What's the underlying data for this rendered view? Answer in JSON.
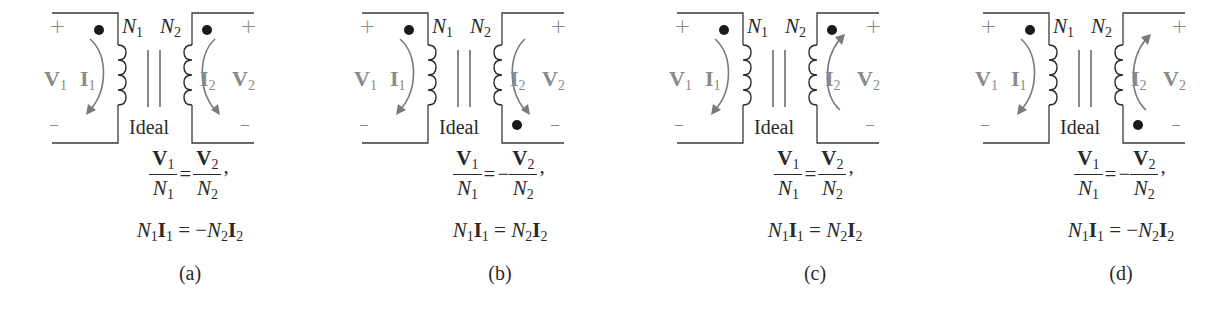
{
  "figure": {
    "labels": {
      "n1": "N",
      "n1_sub": "1",
      "n2": "N",
      "n2_sub": "2",
      "v1": "V",
      "v1_sub": "1",
      "v2": "V",
      "v2_sub": "2",
      "i1": "I",
      "i1_sub": "1",
      "i2": "I",
      "i2_sub": "2",
      "plus": "+",
      "minus": "–",
      "ideal": "Ideal"
    },
    "colors": {
      "wire": "#3a3a3a",
      "current_arrow": "#7a7a7a",
      "dot": "#1a1a1a",
      "text_gray": "#8a8a8a",
      "text": "#2a2a2a"
    },
    "panels": [
      {
        "caption": "(a)",
        "secondary_dot": "top",
        "i1_direction": "down",
        "i2_direction": "down",
        "voltage_eq": {
          "lhs_num": "V",
          "lhs_num_sub": "1",
          "lhs_den": "N",
          "lhs_den_sub": "1",
          "sign": "=",
          "neg": "",
          "rhs_num": "V",
          "rhs_num_sub": "2",
          "rhs_den": "N",
          "rhs_den_sub": "2",
          "trail": ","
        },
        "current_eq": {
          "n1": "N",
          "n1_sub": "1",
          "i1": "I",
          "i1_sub": "1",
          "eq": " = ",
          "neg": "−",
          "n2": "N",
          "n2_sub": "2",
          "i2": "I",
          "i2_sub": "2"
        }
      },
      {
        "caption": "(b)",
        "secondary_dot": "bottom",
        "i1_direction": "down",
        "i2_direction": "down",
        "voltage_eq": {
          "lhs_num": "V",
          "lhs_num_sub": "1",
          "lhs_den": "N",
          "lhs_den_sub": "1",
          "sign": "=",
          "neg": "−",
          "rhs_num": "V",
          "rhs_num_sub": "2",
          "rhs_den": "N",
          "rhs_den_sub": "2",
          "trail": ","
        },
        "current_eq": {
          "n1": "N",
          "n1_sub": "1",
          "i1": "I",
          "i1_sub": "1",
          "eq": " = ",
          "neg": "",
          "n2": "N",
          "n2_sub": "2",
          "i2": "I",
          "i2_sub": "2"
        }
      },
      {
        "caption": "(c)",
        "secondary_dot": "top",
        "i1_direction": "down",
        "i2_direction": "up",
        "voltage_eq": {
          "lhs_num": "V",
          "lhs_num_sub": "1",
          "lhs_den": "N",
          "lhs_den_sub": "1",
          "sign": "=",
          "neg": "",
          "rhs_num": "V",
          "rhs_num_sub": "2",
          "rhs_den": "N",
          "rhs_den_sub": "2",
          "trail": ","
        },
        "current_eq": {
          "n1": "N",
          "n1_sub": "1",
          "i1": "I",
          "i1_sub": "1",
          "eq": " = ",
          "neg": "",
          "n2": "N",
          "n2_sub": "2",
          "i2": "I",
          "i2_sub": "2"
        }
      },
      {
        "caption": "(d)",
        "secondary_dot": "bottom",
        "i1_direction": "down",
        "i2_direction": "up",
        "voltage_eq": {
          "lhs_num": "V",
          "lhs_num_sub": "1",
          "lhs_den": "N",
          "lhs_den_sub": "1",
          "sign": "=",
          "neg": "−",
          "rhs_num": "V",
          "rhs_num_sub": "2",
          "rhs_den": "N",
          "rhs_den_sub": "2",
          "trail": ","
        },
        "current_eq": {
          "n1": "N",
          "n1_sub": "1",
          "i1": "I",
          "i1_sub": "1",
          "eq": " = ",
          "neg": "−",
          "n2": "N",
          "n2_sub": "2",
          "i2": "I",
          "i2_sub": "2"
        }
      }
    ]
  }
}
